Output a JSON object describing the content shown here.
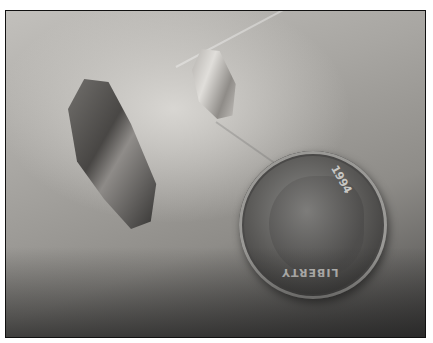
{
  "image": {
    "description": "Photograph of two crystals next to a US dime on a palm",
    "subjects": [
      {
        "name": "large-crystal",
        "tone": "dark smoky"
      },
      {
        "name": "small-crystal",
        "tone": "clear pale"
      },
      {
        "name": "dime-coin",
        "date": "1994",
        "motto": "LIBERTY"
      }
    ],
    "border_color": "#111111",
    "background_color": "#ffffff"
  },
  "coin": {
    "date_text": "1994",
    "motto_text": "LIBERTY"
  }
}
